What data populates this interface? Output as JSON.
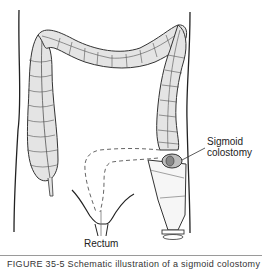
{
  "figure": {
    "labels": {
      "sigmoid_line1": "Sigmoid",
      "sigmoid_line2": "colostomy",
      "rectum": "Rectum"
    },
    "caption": "FIGURE 35-5 Schematic illustration of a sigmoid colostomy",
    "colors": {
      "colon_fill": "#e4e4e4",
      "outline": "#333333",
      "dashed": "#666666",
      "rule": "#9a9a9a"
    }
  }
}
